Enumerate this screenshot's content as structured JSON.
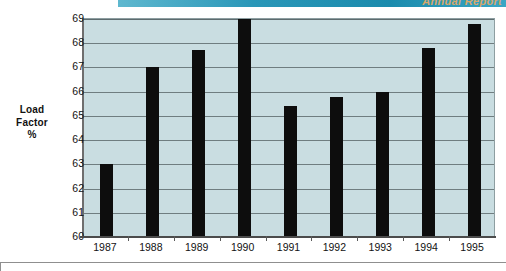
{
  "banner": {
    "text": "Annual Report",
    "color": "#1b8bad"
  },
  "chart_data": {
    "type": "bar",
    "title": "",
    "subtitle": "",
    "xlabel": "",
    "ylabel": "Load Factor %",
    "ylabel_lines": [
      "Load",
      "Factor",
      "%"
    ],
    "categories": [
      "1987",
      "1988",
      "1989",
      "1990",
      "1991",
      "1992",
      "1993",
      "1994",
      "1995"
    ],
    "values": [
      63.0,
      67.0,
      67.7,
      69.0,
      65.4,
      65.8,
      66.0,
      67.8,
      68.8
    ],
    "ylim": [
      60,
      69
    ],
    "yticks": [
      69,
      68,
      67,
      66,
      65,
      64,
      63,
      62,
      61,
      60
    ],
    "ytick_labels": [
      "69",
      "68",
      "67",
      "66",
      "65",
      "64",
      "63",
      "62",
      "61",
      "60"
    ],
    "grid": true,
    "legend": false,
    "legend_position": "none",
    "bar_color": "#0d0d0d",
    "plot_background": "#c9dde1",
    "gridline_color": "#6f7d80"
  }
}
